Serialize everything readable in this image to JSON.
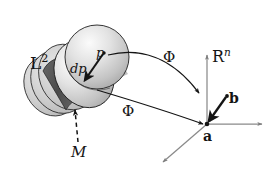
{
  "figure": {
    "name": "manifold-to-rn-map-diagram",
    "background_color": "#ffffff",
    "ink_color": "#141414",
    "axis_color": "#8a8a8a"
  },
  "labels": {
    "domain_space": "L",
    "domain_space_exponent": "2",
    "codomain_space": "R",
    "codomain_space_exponent": "n",
    "map_upper": "Φ",
    "map_lower": "Φ",
    "point_p": "p",
    "tangent_dp": "dp",
    "submanifold_M": "M",
    "point_a": "a",
    "point_b": "b"
  },
  "shapes": {
    "manifold_stack": {
      "description": "tilted stack of overlapping shaded discs forming a cylinder",
      "disc_count": 5,
      "light_fill": "#cfcfcf",
      "highlight_fill": "#f2f2f2",
      "dark_band_fill": "#545454",
      "outline": "#1a1a1a"
    },
    "rn_axes": {
      "origin_label": "a",
      "axis_right": true,
      "axis_up": true,
      "axis_down_left": true
    }
  },
  "arrows": {
    "phi_upper": {
      "from": "p",
      "to": "b",
      "style": "curved"
    },
    "phi_lower": {
      "from": "M",
      "to": "a",
      "style": "curved"
    },
    "dp_vector": {
      "from": "p",
      "to": "dark-band",
      "style": "straight-thick"
    },
    "b_to_a_vector": {
      "from": "b",
      "to": "a",
      "style": "straight-thick"
    },
    "m_pointer": {
      "from": "M",
      "to": "dark-band",
      "style": "dashed"
    }
  }
}
